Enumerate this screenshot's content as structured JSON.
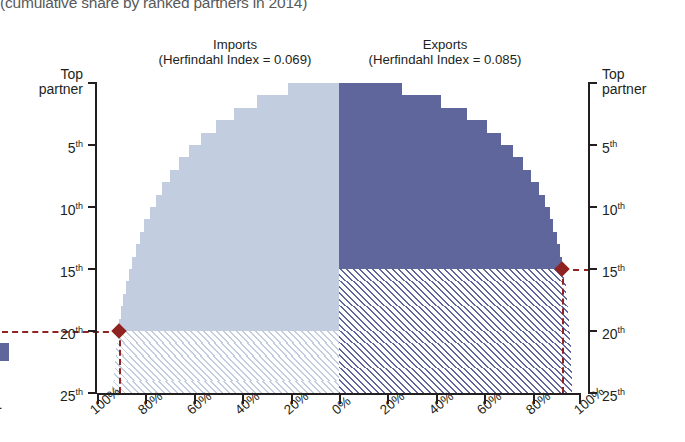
{
  "caption": "(cumulative share by ranked partners in 2014)",
  "panels": {
    "imports": {
      "title": "Imports",
      "subtitle": "(Herfindahl Index = 0.069)",
      "color": "#c3cde0"
    },
    "exports": {
      "title": "Exports",
      "subtitle": "(Herfindahl Index = 0.085)",
      "color": "#5f669b"
    }
  },
  "axes": {
    "y_left_labels": [
      "Top partner",
      "5th",
      "10th",
      "15th",
      "20th",
      "25th"
    ],
    "y_right_labels": [
      "Top partner",
      "5th",
      "10th",
      "15th",
      "20th",
      "25th"
    ],
    "y_left_top_line1": "Top",
    "y_left_top_line2": "partner",
    "y_right_top_line1": "Top",
    "y_right_top_line2": "partner",
    "x_labels_left": [
      "100%",
      "80%",
      "60%",
      "40%",
      "20%",
      "0%"
    ],
    "x_labels_right": [
      "20%",
      "40%",
      "60%",
      "80%",
      "100%"
    ],
    "x_labels_all": [
      "100%",
      "80%",
      "60%",
      "40%",
      "20%",
      "0%",
      "20%",
      "40%",
      "60%",
      "80%",
      "100%"
    ]
  },
  "marker": {
    "color": "#8e2321",
    "imports_rank": "20th",
    "exports_rank": "15th",
    "threshold": "90%"
  },
  "chart_data": {
    "type": "bar",
    "subtitle": "(cumulative share by ranked partners in 2014)",
    "orientation": "horizontal-diverging",
    "xlabel": "",
    "ylabel": "Ranked partner",
    "xlim": [
      -100,
      100
    ],
    "ylim": [
      1,
      26
    ],
    "grid": false,
    "legend": "none",
    "categories": [
      "1",
      "2",
      "3",
      "4",
      "5",
      "6",
      "7",
      "8",
      "9",
      "10",
      "11",
      "12",
      "13",
      "14",
      "15",
      "16",
      "17",
      "18",
      "19",
      "20",
      "21",
      "22",
      "23",
      "24",
      "25"
    ],
    "category_labels": [
      "Top partner",
      "2nd",
      "3rd",
      "4th",
      "5th",
      "6th",
      "7th",
      "8th",
      "9th",
      "10th",
      "11th",
      "12th",
      "13th",
      "14th",
      "15th",
      "16th",
      "17th",
      "18th",
      "19th",
      "20th",
      "21st",
      "22nd",
      "23rd",
      "24th",
      "25th"
    ],
    "series": [
      {
        "name": "Imports",
        "herfindahl_index": 0.069,
        "direction": "left",
        "color": "#c3cde0",
        "threshold_rank": 20,
        "values": [
          21.0,
          34.0,
          43.5,
          51.0,
          57.0,
          62.0,
          66.2,
          69.8,
          73.0,
          75.8,
          78.2,
          80.4,
          82.3,
          84.0,
          85.5,
          86.9,
          88.1,
          89.1,
          90.0,
          90.8,
          91.5,
          92.1,
          92.6,
          93.1,
          93.6
        ]
      },
      {
        "name": "Exports",
        "herfindahl_index": 0.085,
        "direction": "right",
        "color": "#5f669b",
        "threshold_rank": 15,
        "values": [
          26.0,
          42.0,
          53.0,
          61.0,
          67.0,
          72.0,
          76.0,
          79.5,
          82.5,
          85.0,
          87.0,
          88.6,
          90.0,
          91.2,
          92.2,
          93.0,
          93.7,
          94.3,
          94.8,
          95.2,
          95.5,
          95.8,
          96.0,
          96.2,
          96.3
        ]
      }
    ],
    "annotations": [
      {
        "label": "Imports 90% threshold",
        "rank": 20,
        "value": 90.0,
        "marker": "diamond",
        "color": "#8e2321"
      },
      {
        "label": "Exports 90% threshold",
        "rank": 15,
        "value": 90.0,
        "marker": "diamond",
        "color": "#8e2321"
      }
    ]
  }
}
